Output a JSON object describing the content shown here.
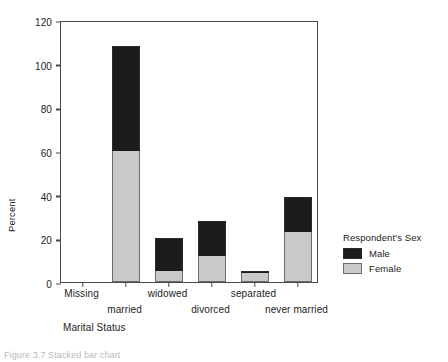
{
  "chart_data": {
    "type": "bar",
    "stacked": true,
    "title": "",
    "xlabel": "Marital Status",
    "ylabel": "Percent",
    "ylim": [
      0,
      120
    ],
    "yticks": [
      0,
      20,
      40,
      60,
      80,
      100,
      120
    ],
    "grid": false,
    "legend": {
      "title": "Respondent's Sex",
      "position": "right",
      "entries": [
        {
          "name": "Male",
          "color": "#1c1c1c"
        },
        {
          "name": "Female",
          "color": "#c9c9c9"
        }
      ]
    },
    "categories": [
      "Missing",
      "married",
      "widowed",
      "divorced",
      "separated",
      "never married"
    ],
    "series": [
      {
        "name": "Female",
        "color": "#c9c9c9",
        "values": [
          0,
          60,
          5,
          12,
          4,
          23
        ]
      },
      {
        "name": "Male",
        "color": "#1c1c1c",
        "values": [
          0,
          48,
          15,
          16,
          1,
          16
        ]
      }
    ],
    "totals": [
      0,
      108,
      20,
      28,
      5,
      39
    ]
  },
  "caption": "Figure 3.7  Stacked bar chart",
  "axis": {
    "ylabel": "Percent",
    "xlabel": "Marital Status"
  }
}
